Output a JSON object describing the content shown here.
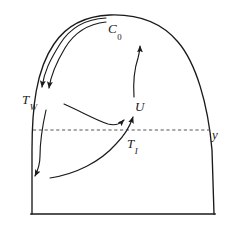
{
  "figure": {
    "type": "schematic-diagram",
    "background_color": "#ffffff",
    "line_color": "#1a1a1a",
    "dashed_line_color": "#555555",
    "canvas": {
      "width": 249,
      "height": 225
    }
  },
  "labels": {
    "c0": {
      "base": "C",
      "sub": "0"
    },
    "tw": {
      "base": "T",
      "sub": "W"
    },
    "u": {
      "base": "U",
      "sub": ""
    },
    "ti": {
      "base": "T",
      "sub": "I"
    },
    "y": {
      "base": "y",
      "sub": ""
    }
  },
  "elements": {
    "outline_name": "droplet-outline",
    "dashed_line_name": "interface-dashed-line",
    "arrows": [
      {
        "name": "wall-arrow-outer",
        "points_to": "T_W"
      },
      {
        "name": "wall-arrow-inner",
        "points_to": "T_W"
      },
      {
        "name": "wall-downflow-arrow",
        "points_to": "bottom-left"
      },
      {
        "name": "mid-circulation-arrow",
        "points_to": "U"
      },
      {
        "name": "bottom-upflow-arrow",
        "points_to": "T_I"
      },
      {
        "name": "core-upflow-arrow",
        "points_to": "C_0"
      }
    ]
  }
}
